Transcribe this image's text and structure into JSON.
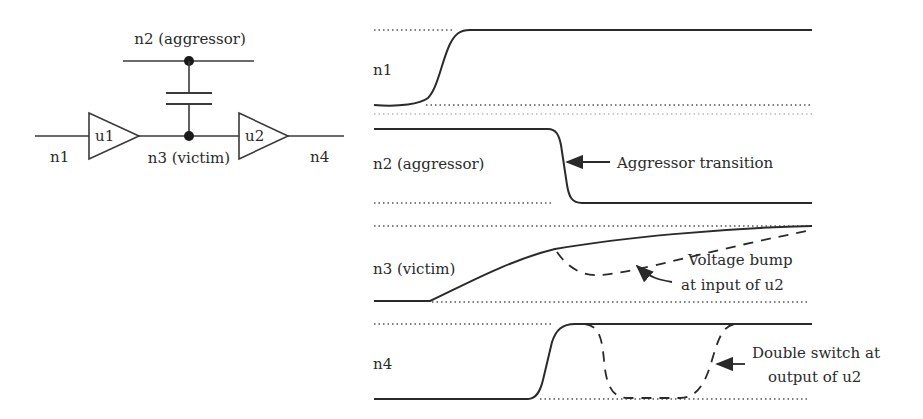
{
  "schematic": {
    "aggressor_label": "n2 (aggressor)",
    "victim_label": "n3 (victim)",
    "input_label": "n1",
    "output_label": "n4",
    "buffer1_label": "u1",
    "buffer2_label": "u2"
  },
  "waveforms": [
    {
      "name": "n1",
      "label": "n1",
      "style": "solid"
    },
    {
      "name": "n2",
      "label": "n2 (aggressor)",
      "style": "solid"
    },
    {
      "name": "n3",
      "label": "n3 (victim)",
      "style": "solid+dashed"
    },
    {
      "name": "n4",
      "label": "n4",
      "style": "solid+dashed"
    }
  ],
  "annotations": {
    "aggressor": "Aggressor transition",
    "bump_line1": "Voltage bump",
    "bump_line2": "at input of u2",
    "double_line1": "Double switch at",
    "double_line2": "output of u2"
  },
  "colors": {
    "ink": "#2a2a2a",
    "background": "#ffffff"
  }
}
